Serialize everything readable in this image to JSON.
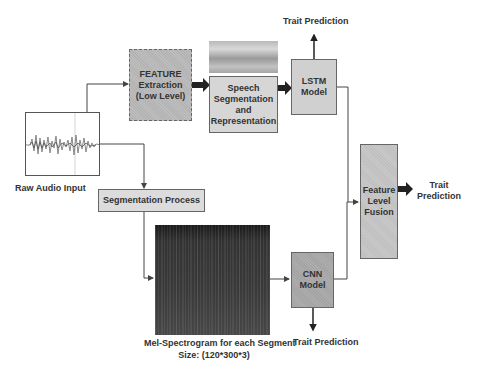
{
  "diagram": {
    "nodes": {
      "raw_audio": {
        "label": "Raw Audio Input"
      },
      "feature_extraction": {
        "line1": "FEATURE",
        "line2": "Extraction",
        "line3": "(Low Level)"
      },
      "speech_segmentation": {
        "line1": "Speech",
        "line2": "Segmentation",
        "line3": "and",
        "line4": "Representation"
      },
      "lstm": {
        "line1": "LSTM",
        "line2": "Model"
      },
      "segmentation_process": {
        "label": "Segmentation Process"
      },
      "mel_spectrogram": {
        "line1": "Mel-Spectrogram for each Segment",
        "line2": "Size: (120*300*3)"
      },
      "cnn": {
        "line1": "CNN",
        "line2": "Model"
      },
      "fusion": {
        "line1": "Feature",
        "line2": "Level",
        "line3": "Fusion"
      }
    },
    "outputs": {
      "lstm_output": "Trait Prediction",
      "cnn_output": "Trait Prediction",
      "fusion_output_line1": "Trait",
      "fusion_output_line2": "Prediction"
    },
    "colors": {
      "feature_box": "#b8b8b8",
      "speech_box": "#d6d6d6",
      "lstm_box": "#d0d0d0",
      "segmentation_box": "#dcdcdc",
      "cnn_box": "#a8a8a8",
      "fusion_box": "#c4c4c4"
    }
  }
}
